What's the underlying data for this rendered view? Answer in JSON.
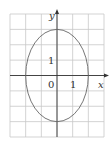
{
  "diagram": {
    "type": "ellipse-on-grid",
    "grid": {
      "x_min": -3,
      "x_max": 3,
      "y_min": -4,
      "y_max": 4,
      "step": 1
    },
    "axes": {
      "x_label": "x",
      "y_label": "y",
      "origin_label": "0",
      "x_tick_label": "1",
      "y_tick_label": "1"
    },
    "ellipse": {
      "center": [
        0,
        0
      ],
      "semi_axis_x": 2,
      "semi_axis_y": 3,
      "semi_axes_estimated": true
    },
    "colors": {
      "grid": "#c8c8c8",
      "axis": "#333333",
      "curve": "#666666"
    }
  }
}
